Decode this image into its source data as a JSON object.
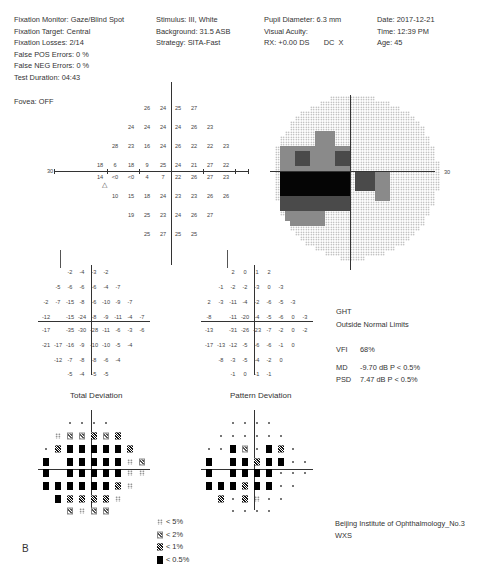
{
  "header": {
    "col1": [
      "Fixation Monitor: Gaze/Blind Spot",
      "Fixation Target: Central",
      "Fixation Losses: 2/14",
      "False POS Errors:  0 %",
      "False NEG Errors:  0 %",
      "Test Duration: 04:43"
    ],
    "col2": [
      "Stimulus: III, White",
      "Background: 31.5 ASB",
      "Strategy: SITA-Fast"
    ],
    "col3": [
      "Pupil Diameter: 6.3 mm",
      "Visual Acuity:",
      "RX: +0.00 DS       DC  X"
    ],
    "col4": [
      "Date: 2017-12-21",
      "Time: 12:39 PM",
      "Age: 45"
    ],
    "fovea": "Fovea: OFF"
  },
  "threshold_plot": {
    "axis_label_left": "30",
    "axis_label_right": "30",
    "rows": [
      {
        "y": 108,
        "cells": [
          {
            "x": 147,
            "v": "26"
          },
          {
            "x": 163,
            "v": "24"
          },
          {
            "x": 178,
            "v": "25"
          },
          {
            "x": 194,
            "v": "27"
          }
        ]
      },
      {
        "y": 127,
        "cells": [
          {
            "x": 131,
            "v": "24"
          },
          {
            "x": 147,
            "v": "24"
          },
          {
            "x": 163,
            "v": "24"
          },
          {
            "x": 178,
            "v": "24"
          },
          {
            "x": 194,
            "v": "26"
          },
          {
            "x": 210,
            "v": "23"
          }
        ]
      },
      {
        "y": 146,
        "cells": [
          {
            "x": 115,
            "v": "28"
          },
          {
            "x": 131,
            "v": "23"
          },
          {
            "x": 147,
            "v": "16"
          },
          {
            "x": 163,
            "v": "24"
          },
          {
            "x": 178,
            "v": "26"
          },
          {
            "x": 194,
            "v": "22"
          },
          {
            "x": 210,
            "v": "22"
          },
          {
            "x": 226,
            "v": "23"
          }
        ]
      },
      {
        "y": 165,
        "cells": [
          {
            "x": 100,
            "v": "18"
          },
          {
            "x": 115,
            "v": "6"
          },
          {
            "x": 131,
            "v": "18"
          },
          {
            "x": 147,
            "v": "9"
          },
          {
            "x": 163,
            "v": "25"
          },
          {
            "x": 178,
            "v": "24"
          },
          {
            "x": 194,
            "v": "21"
          },
          {
            "x": 210,
            "v": "27"
          },
          {
            "x": 226,
            "v": "22"
          }
        ]
      },
      {
        "y": 177,
        "cells": [
          {
            "x": 100,
            "v": "14"
          },
          {
            "x": 115,
            "v": "<0"
          },
          {
            "x": 131,
            "v": "<0"
          },
          {
            "x": 147,
            "v": "4"
          },
          {
            "x": 163,
            "v": "7"
          },
          {
            "x": 178,
            "v": "22"
          },
          {
            "x": 194,
            "v": "26"
          },
          {
            "x": 210,
            "v": "27"
          },
          {
            "x": 226,
            "v": "23"
          }
        ]
      },
      {
        "y": 196,
        "cells": [
          {
            "x": 115,
            "v": "10"
          },
          {
            "x": 131,
            "v": "15"
          },
          {
            "x": 147,
            "v": "18"
          },
          {
            "x": 163,
            "v": "24"
          },
          {
            "x": 178,
            "v": "23"
          },
          {
            "x": 194,
            "v": "23"
          },
          {
            "x": 210,
            "v": "26"
          },
          {
            "x": 226,
            "v": "26"
          }
        ]
      },
      {
        "y": 215,
        "cells": [
          {
            "x": 131,
            "v": "19"
          },
          {
            "x": 147,
            "v": "25"
          },
          {
            "x": 163,
            "v": "23"
          },
          {
            "x": 178,
            "v": "24"
          },
          {
            "x": 194,
            "v": "26"
          },
          {
            "x": 210,
            "v": "27"
          }
        ]
      },
      {
        "y": 234,
        "cells": [
          {
            "x": 147,
            "v": "25"
          },
          {
            "x": 163,
            "v": "27"
          },
          {
            "x": 178,
            "v": "25"
          },
          {
            "x": 194,
            "v": "25"
          }
        ]
      }
    ],
    "blind_spot_marker": "△"
  },
  "total_deviation": {
    "title": "Total Deviation",
    "rows": [
      [
        "",
        "",
        "",
        "-2",
        "-4",
        "-3",
        "-2",
        "",
        "",
        ""
      ],
      [
        "",
        "",
        "-5",
        "-6",
        "-6",
        "-6",
        "-4",
        "-7",
        "",
        ""
      ],
      [
        "",
        "-2",
        "-7",
        "-15",
        "-8",
        "-6",
        "-10",
        "-9",
        "-7",
        ""
      ],
      [
        "",
        "-12",
        "",
        "-15",
        "-24",
        "-8",
        "-9",
        "-11",
        "-4",
        "-7"
      ],
      [
        "",
        "-17",
        "",
        "-35",
        "-30",
        "-28",
        "-11",
        "-6",
        "-3",
        "-6"
      ],
      [
        "",
        "-21",
        "-17",
        "-16",
        "-9",
        "-10",
        "-10",
        "-5",
        "-4",
        ""
      ],
      [
        "",
        "",
        "-12",
        "-7",
        "-8",
        "-8",
        "-6",
        "-4",
        "",
        ""
      ],
      [
        "",
        "",
        "",
        "-5",
        "-4",
        "-5",
        "-5",
        "",
        "",
        ""
      ]
    ]
  },
  "pattern_deviation": {
    "title": "Pattern Deviation",
    "rows": [
      [
        "",
        "",
        "",
        "2",
        "0",
        "1",
        "2",
        "",
        "",
        ""
      ],
      [
        "",
        "",
        "-1",
        "-2",
        "-2",
        "-3",
        "0",
        "-3",
        "",
        ""
      ],
      [
        "",
        "2",
        "-3",
        "-11",
        "-4",
        "-2",
        "-6",
        "-5",
        "-3",
        ""
      ],
      [
        "",
        "-8",
        "",
        "-11",
        "-20",
        "-4",
        "-5",
        "-6",
        "0",
        "-3"
      ],
      [
        "",
        "-13",
        "",
        "-31",
        "-26",
        "-23",
        "-7",
        "-2",
        "0",
        "-2"
      ],
      [
        "",
        "-17",
        "-13",
        "-12",
        "-5",
        "-6",
        "-6",
        "-1",
        "0",
        ""
      ],
      [
        "",
        "",
        "-8",
        "-3",
        "-5",
        "-4",
        "-2",
        "0",
        "",
        ""
      ],
      [
        "",
        "",
        "",
        "-1",
        "0",
        "-1",
        "-1",
        "",
        "",
        ""
      ]
    ]
  },
  "td_symbols": {
    "rows": [
      [
        "",
        "",
        "",
        "dot",
        "dot",
        "dot",
        "dot",
        "",
        "",
        ""
      ],
      [
        "",
        "",
        "p5",
        "p2",
        "p2",
        "p1",
        "p2",
        "p1",
        "",
        ""
      ],
      [
        "",
        "dot",
        "p1",
        "p05",
        "p05",
        "p05",
        "p05",
        "p05",
        "p1",
        ""
      ],
      [
        "",
        "p05",
        "",
        "p05",
        "p05",
        "p05",
        "p05",
        "p05",
        "p5",
        "p2"
      ],
      [
        "",
        "p05",
        "",
        "p05",
        "p05",
        "p05",
        "p05",
        "p05",
        "p5",
        "p5"
      ],
      [
        "",
        "p05",
        "p05",
        "p05",
        "p05",
        "p05",
        "p05",
        "p1",
        "p5",
        ""
      ],
      [
        "",
        "",
        "p05",
        "p1",
        "p1",
        "p1",
        "p1",
        "p5",
        "",
        ""
      ],
      [
        "",
        "",
        "",
        "p2",
        "p5",
        "p2",
        "p2",
        "",
        "",
        ""
      ]
    ]
  },
  "pd_symbols": {
    "rows": [
      [
        "",
        "",
        "",
        "dot",
        "dot",
        "dot",
        "dot",
        "",
        "",
        ""
      ],
      [
        "",
        "",
        "dot",
        "dot",
        "dot",
        "dot",
        "dot",
        "dot",
        "",
        ""
      ],
      [
        "",
        "dot",
        "dot",
        "p05",
        "p2",
        "dot",
        "p05",
        "p1",
        "dot",
        ""
      ],
      [
        "",
        "p05",
        "",
        "p05",
        "p05",
        "p1",
        "p05",
        "p05",
        "dot",
        "dot"
      ],
      [
        "",
        "p05",
        "",
        "p05",
        "p05",
        "p05",
        "p05",
        "dot",
        "dot",
        "dot"
      ],
      [
        "",
        "p05",
        "p05",
        "p05",
        "p1",
        "p05",
        "p05",
        "dot",
        "dot",
        ""
      ],
      [
        "",
        "",
        "p1",
        "dot",
        "p1",
        "p5",
        "dot",
        "dot",
        "",
        ""
      ],
      [
        "",
        "",
        "",
        "dot",
        "dot",
        "dot",
        "dot",
        "",
        "",
        ""
      ]
    ]
  },
  "indices": {
    "ght_label": "GHT",
    "ght_value": "Outside Normal Limits",
    "vfi_label": "VFI",
    "vfi_value": "68%",
    "md_label": "MD",
    "md_value": "-9.70 dB  P < 0.5%",
    "psd_label": "PSD",
    "psd_value": "7.47 dB  P < 0.5%"
  },
  "legend": [
    {
      "symbol": "p5",
      "label": "< 5%"
    },
    {
      "symbol": "p2",
      "label": "< 2%"
    },
    {
      "symbol": "p1",
      "label": "< 1%"
    },
    {
      "symbol": "p05",
      "label": "< 0.5%"
    }
  ],
  "footer": {
    "institution": "Beijing Institute of Ophthalmology_No.3",
    "operator": "WXS",
    "panel_letter": "B"
  },
  "grayscale": {
    "axis_label": "30",
    "colors": {
      "light": "#d8d8d8",
      "mid": "#8a8a8a",
      "dark": "#4a4a4a",
      "black": "#050505"
    }
  }
}
